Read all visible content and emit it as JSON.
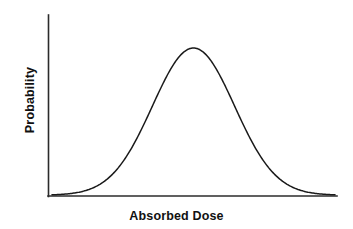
{
  "figure": {
    "background_color": "#ffffff",
    "line_color": "#1a1a1a",
    "axis_color": "#2b2b2b"
  },
  "labels": {
    "xlabel": "Absorbed Dose",
    "ylabel": "Probability"
  },
  "chart_data": {
    "type": "line",
    "title": "",
    "subtitle": "",
    "xlabel": "Absorbed Dose",
    "ylabel": "Probability",
    "legend": [],
    "legend_position": "none",
    "grid": false,
    "xticks": [],
    "yticks": [],
    "xtick_labels": [],
    "ytick_labels": [],
    "xlim": [
      0,
      1
    ],
    "ylim": [
      0,
      1
    ],
    "annotations": [],
    "series": [
      {
        "name": "probability density",
        "distribution": "gaussian",
        "mean": 0.5,
        "sigma": 0.145,
        "peak_x": 0.5,
        "peak_y": 0.93,
        "x": [
          0.0,
          0.05,
          0.1,
          0.15,
          0.2,
          0.25,
          0.3,
          0.35,
          0.4,
          0.45,
          0.5,
          0.55,
          0.6,
          0.65,
          0.7,
          0.75,
          0.8,
          0.85,
          0.9,
          0.95,
          1.0
        ],
        "values": [
          0.003,
          0.006,
          0.012,
          0.026,
          0.052,
          0.098,
          0.175,
          0.3,
          0.5,
          0.76,
          0.93,
          0.76,
          0.5,
          0.3,
          0.175,
          0.098,
          0.052,
          0.026,
          0.012,
          0.006,
          0.003
        ]
      }
    ]
  }
}
